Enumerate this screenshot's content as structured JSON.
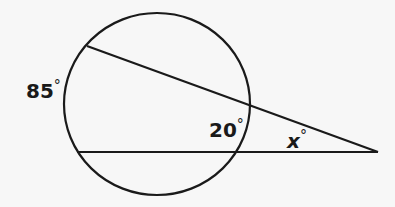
{
  "diagram": {
    "type": "circle with two secants intersecting outside",
    "stroke_color": "#1a1a1a",
    "background_color": "#f7f7f7",
    "labels": {
      "far_arc": {
        "value": "85",
        "unit": "°"
      },
      "near_arc": {
        "value": "20",
        "unit": "°"
      },
      "angle": {
        "value": "x",
        "unit": "°"
      }
    }
  }
}
